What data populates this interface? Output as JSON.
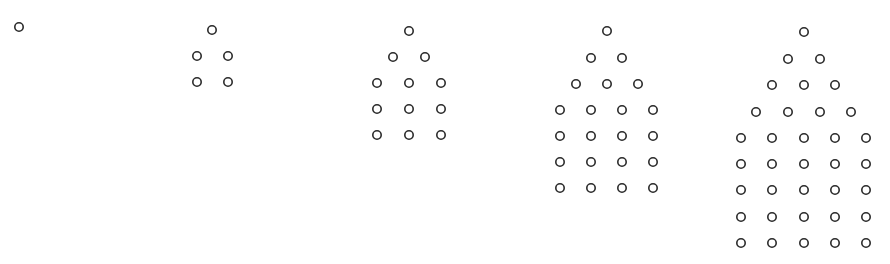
{
  "diagram": {
    "type": "dot-pattern-sequence",
    "style": {
      "circle_radius": 4.2,
      "stroke_width": 1.6,
      "stroke_color": "#2a2a2a",
      "fill_color": "#ffffff",
      "background": "#ffffff"
    },
    "figures": [
      {
        "index": 1,
        "total_circles": 1,
        "rows": [
          {
            "y": 27,
            "xs": [
              19
            ]
          }
        ]
      },
      {
        "index": 2,
        "total_circles": 5,
        "rows": [
          {
            "y": 30,
            "xs": [
              212
            ]
          },
          {
            "y": 56,
            "xs": [
              197,
              228
            ]
          },
          {
            "y": 82,
            "xs": [
              197,
              228
            ]
          }
        ]
      },
      {
        "index": 3,
        "total_circles": 12,
        "rows": [
          {
            "y": 31,
            "xs": [
              409
            ]
          },
          {
            "y": 57,
            "xs": [
              393,
              425
            ]
          },
          {
            "y": 83,
            "xs": [
              377,
              409,
              441
            ]
          },
          {
            "y": 109,
            "xs": [
              377,
              409,
              441
            ]
          },
          {
            "y": 135,
            "xs": [
              377,
              409,
              441
            ]
          }
        ]
      },
      {
        "index": 4,
        "total_circles": 22,
        "rows": [
          {
            "y": 31,
            "xs": [
              607
            ]
          },
          {
            "y": 58,
            "xs": [
              591,
              622
            ]
          },
          {
            "y": 84,
            "xs": [
              576,
              607,
              638
            ]
          },
          {
            "y": 110,
            "xs": [
              560,
              591,
              622,
              653
            ]
          },
          {
            "y": 136,
            "xs": [
              560,
              591,
              622,
              653
            ]
          },
          {
            "y": 162,
            "xs": [
              560,
              591,
              622,
              653
            ]
          },
          {
            "y": 188,
            "xs": [
              560,
              591,
              622,
              653
            ]
          }
        ]
      },
      {
        "index": 5,
        "total_circles": 35,
        "rows": [
          {
            "y": 32,
            "xs": [
              804
            ]
          },
          {
            "y": 59,
            "xs": [
              788,
              820
            ]
          },
          {
            "y": 85,
            "xs": [
              772,
              804,
              835
            ]
          },
          {
            "y": 112,
            "xs": [
              756,
              788,
              820,
              851
            ]
          },
          {
            "y": 138,
            "xs": [
              741,
              772,
              804,
              835,
              866
            ]
          },
          {
            "y": 164,
            "xs": [
              741,
              772,
              804,
              835,
              866
            ]
          },
          {
            "y": 190,
            "xs": [
              741,
              772,
              804,
              835,
              866
            ]
          },
          {
            "y": 217,
            "xs": [
              741,
              772,
              804,
              835,
              866
            ]
          },
          {
            "y": 243,
            "xs": [
              741,
              772,
              804,
              835,
              866
            ]
          }
        ]
      }
    ]
  }
}
